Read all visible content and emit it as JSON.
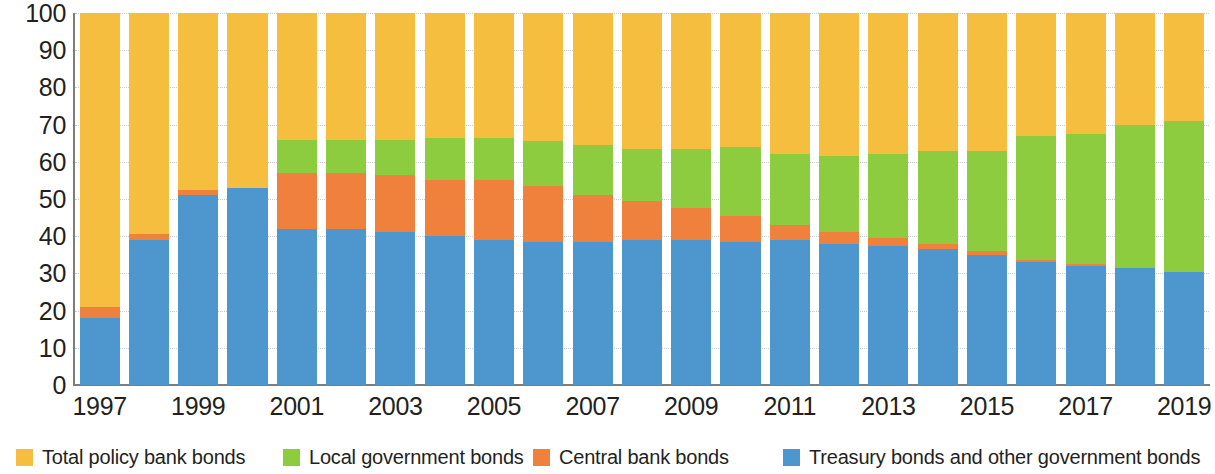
{
  "chart_data": {
    "type": "bar",
    "stacked": true,
    "title": "",
    "subtitle": "",
    "xlabel": "",
    "ylabel": "",
    "ylim": [
      0,
      100
    ],
    "ytick_values": [
      0,
      10,
      20,
      30,
      40,
      50,
      60,
      70,
      80,
      90,
      100
    ],
    "ytick_labels": [
      "0",
      "10",
      "20",
      "30",
      "40",
      "50",
      "60",
      "70",
      "80",
      "90",
      "100"
    ],
    "grid": true,
    "grid_axis": "y",
    "legend_position": "bottom",
    "categories": [
      "1997",
      "1998",
      "1999",
      "2000",
      "2001",
      "2002",
      "2003",
      "2004",
      "2005",
      "2006",
      "2007",
      "2008",
      "2009",
      "2010",
      "2011",
      "2012",
      "2013",
      "2014",
      "2015",
      "2016",
      "2017",
      "2018",
      "2019"
    ],
    "xtick_labels": [
      "1997",
      "",
      "1999",
      "",
      "2001",
      "",
      "2003",
      "",
      "2005",
      "",
      "2007",
      "",
      "2009",
      "",
      "2011",
      "",
      "2013",
      "",
      "2015",
      "",
      "2017",
      "",
      "2019"
    ],
    "series": [
      {
        "name": "Treasury bonds and other government bonds",
        "color": "#4E97CE",
        "values": [
          18,
          39,
          51,
          53,
          42,
          42,
          41,
          40,
          39,
          38.5,
          38.5,
          39,
          39,
          38.5,
          39,
          38,
          37.5,
          36.5,
          35,
          33,
          32,
          31.5,
          30.5
        ]
      },
      {
        "name": "Central bank bonds",
        "color": "#F0813C",
        "values": [
          3,
          1.5,
          1.5,
          0,
          15,
          15,
          15.5,
          15,
          16,
          15,
          12.5,
          10.5,
          8.5,
          7,
          4,
          3,
          2,
          1.5,
          1,
          0.5,
          0.5,
          0,
          0
        ]
      },
      {
        "name": "Local government bonds",
        "color": "#8CCC3E",
        "values": [
          0,
          0,
          0,
          0,
          9,
          9,
          9.5,
          11.5,
          11.5,
          12,
          13.5,
          14,
          16,
          18.5,
          19,
          20.5,
          22.5,
          25,
          27,
          33.5,
          35,
          38.5,
          40.5
        ]
      },
      {
        "name": "Total policy bank bonds",
        "color": "#F5BE3E",
        "values": [
          79,
          59.5,
          47.5,
          47,
          34,
          34,
          34,
          33.5,
          33.5,
          34.5,
          35.5,
          36.5,
          36.5,
          36,
          38,
          38.5,
          38,
          37,
          37,
          33,
          32.5,
          30,
          29
        ]
      }
    ]
  },
  "legend": {
    "items": [
      {
        "label": "Total policy bank bonds",
        "color": "#F5BE3E",
        "icon": "legend-swatch-icon",
        "left_px": 8
      },
      {
        "label": "Local government bonds",
        "color": "#8CCC3E",
        "icon": "legend-swatch-icon",
        "left_px": 275
      },
      {
        "label": "Central bank bonds",
        "color": "#F0813C",
        "icon": "legend-swatch-icon",
        "left_px": 525
      },
      {
        "label": "Treasury bonds and other government bonds",
        "color": "#4E97CE",
        "icon": "legend-swatch-icon",
        "left_px": 775
      }
    ]
  },
  "axes": {
    "y_axis_color": "#7d7d7d",
    "x_axis_color": "#7d7d7d",
    "gridline_color": "#b9c6d6",
    "label_color": "#231f20"
  }
}
